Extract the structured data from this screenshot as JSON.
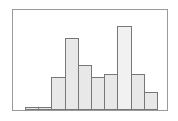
{
  "chart_data": {
    "type": "bar",
    "title": "",
    "xlabel": "",
    "ylabel": "",
    "categories": [
      "1",
      "2",
      "3",
      "4",
      "5",
      "6",
      "7",
      "8",
      "9",
      "10"
    ],
    "values": [
      1,
      1,
      11,
      24,
      15,
      11,
      12,
      28,
      12,
      6
    ],
    "ylim": [
      0,
      30
    ],
    "grid": false,
    "legend": null
  },
  "style": {
    "bar_fill": "#e8e8e8",
    "bar_fill_highlight": "#f1f1f1",
    "bar_outline": "#777777",
    "frame_color": "#9a9a9a",
    "background": "#ffffff"
  }
}
